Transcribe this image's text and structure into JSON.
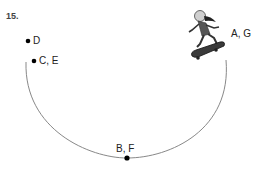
{
  "question_number": "15.",
  "points": [
    {
      "id": "D",
      "label": "D",
      "x": 28,
      "y": 41
    },
    {
      "id": "CE",
      "label": "C, E",
      "x": 34,
      "y": 61
    },
    {
      "id": "BF",
      "label": "B, F",
      "x": 127,
      "y": 158
    },
    {
      "id": "AG",
      "label": "A, G",
      "x": 205,
      "y": 35
    }
  ],
  "figure": {
    "path_color": "#888888",
    "dot_color": "#000000"
  }
}
